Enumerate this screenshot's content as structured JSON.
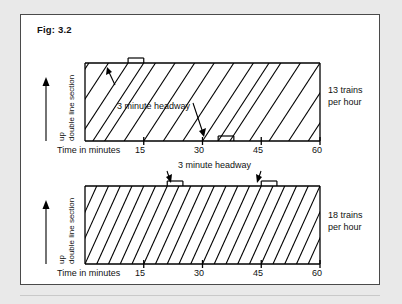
{
  "figure": {
    "title": "Fig: 3.2",
    "background_color": "#e9e9e9",
    "card_color": "#ffffff",
    "border_color": "#4a4a4a",
    "line_color": "#000000"
  },
  "chart_data": [
    {
      "id": "top",
      "type": "line",
      "title": "Fig: 3.2",
      "subtitle": "13 trains per hour",
      "xlabel": "Time in minutes",
      "ylabel": "up  double line section",
      "xlim": [
        0,
        60
      ],
      "xticks": [
        15,
        30,
        45,
        60
      ],
      "xtick_labels": [
        "15",
        "30",
        "45",
        "60"
      ],
      "grid": false,
      "capacity_label": "13 trains",
      "capacity_label_line2": "per hour",
      "trains_per_hour": 13,
      "headway_minutes": 3,
      "annotation": "3 minute  headway",
      "series": [
        {
          "name": "train-path",
          "x_bottom": -12,
          "x_top": 1
        },
        {
          "name": "train-path",
          "x_bottom": -7,
          "x_top": 6
        },
        {
          "name": "train-path",
          "x_bottom": -2,
          "x_top": 11
        },
        {
          "name": "train-path",
          "x_bottom": 2,
          "x_top": 15
        },
        {
          "name": "train-path",
          "x_bottom": 5,
          "x_top": 18
        },
        {
          "name": "train-path",
          "x_bottom": 10,
          "x_top": 23
        },
        {
          "name": "train-path",
          "x_bottom": 15,
          "x_top": 28
        },
        {
          "name": "train-path",
          "x_bottom": 20,
          "x_top": 33
        },
        {
          "name": "train-path",
          "x_bottom": 25,
          "x_top": 38
        },
        {
          "name": "train-path",
          "x_bottom": 30,
          "x_top": 43
        },
        {
          "name": "train-path",
          "x_bottom": 34,
          "x_top": 47
        },
        {
          "name": "train-path",
          "x_bottom": 37,
          "x_top": 50
        },
        {
          "name": "train-path",
          "x_bottom": 42,
          "x_top": 55
        },
        {
          "name": "train-path",
          "x_bottom": 47,
          "x_top": 60
        },
        {
          "name": "train-path",
          "x_bottom": 52,
          "x_top": 65
        },
        {
          "name": "train-path",
          "x_bottom": 57,
          "x_top": 70
        }
      ],
      "headway_markers": [
        {
          "position": "top",
          "x_start": 11,
          "x_end": 15,
          "arrow": "down-left"
        },
        {
          "position": "bottom",
          "x_start": 34,
          "x_end": 38,
          "arrow": "down-right"
        }
      ]
    },
    {
      "id": "bottom",
      "type": "line",
      "subtitle": "18 trains per hour",
      "xlabel": "Time in minutes",
      "ylabel": "up  double line section",
      "xlim": [
        0,
        60
      ],
      "xticks": [
        15,
        30,
        45,
        60
      ],
      "xtick_labels": [
        "15",
        "30",
        "45",
        "60"
      ],
      "grid": false,
      "capacity_label": "18 trains",
      "capacity_label_line2": "per hour",
      "trains_per_hour": 18,
      "headway_minutes": 3,
      "annotation": "3 minute  headway",
      "series": [
        {
          "name": "train-path",
          "x_bottom": -9,
          "x_top": 0
        },
        {
          "name": "train-path",
          "x_bottom": -6,
          "x_top": 3
        },
        {
          "name": "train-path",
          "x_bottom": -3,
          "x_top": 6
        },
        {
          "name": "train-path",
          "x_bottom": 0,
          "x_top": 9
        },
        {
          "name": "train-path",
          "x_bottom": 3,
          "x_top": 12
        },
        {
          "name": "train-path",
          "x_bottom": 6,
          "x_top": 15
        },
        {
          "name": "train-path",
          "x_bottom": 9,
          "x_top": 18
        },
        {
          "name": "train-path",
          "x_bottom": 12,
          "x_top": 21
        },
        {
          "name": "train-path",
          "x_bottom": 15,
          "x_top": 24
        },
        {
          "name": "train-path",
          "x_bottom": 18,
          "x_top": 27
        },
        {
          "name": "train-path",
          "x_bottom": 21,
          "x_top": 30
        },
        {
          "name": "train-path",
          "x_bottom": 24,
          "x_top": 33
        },
        {
          "name": "train-path",
          "x_bottom": 27,
          "x_top": 36
        },
        {
          "name": "train-path",
          "x_bottom": 30,
          "x_top": 39
        },
        {
          "name": "train-path",
          "x_bottom": 33,
          "x_top": 42
        },
        {
          "name": "train-path",
          "x_bottom": 36,
          "x_top": 45
        },
        {
          "name": "train-path",
          "x_bottom": 39,
          "x_top": 48
        },
        {
          "name": "train-path",
          "x_bottom": 42,
          "x_top": 51
        },
        {
          "name": "train-path",
          "x_bottom": 45,
          "x_top": 54
        },
        {
          "name": "train-path",
          "x_bottom": 48,
          "x_top": 57
        },
        {
          "name": "train-path",
          "x_bottom": 51,
          "x_top": 60
        },
        {
          "name": "train-path",
          "x_bottom": 54,
          "x_top": 63
        },
        {
          "name": "train-path",
          "x_bottom": 57,
          "x_top": 66
        }
      ],
      "headway_markers": [
        {
          "position": "top",
          "x_start": 21,
          "x_end": 25,
          "arrow": "down-left"
        },
        {
          "position": "top",
          "x_start": 45,
          "x_end": 49,
          "arrow": "down-right"
        }
      ]
    }
  ],
  "labels": {
    "ylabel_up": "up",
    "ylabel_section": "double line section",
    "xlabel": "Time in minutes",
    "headway_note": "3 minute  headway",
    "top_capacity_l1": "13 trains",
    "top_capacity_l2": "per hour",
    "bottom_capacity_l1": "18 trains",
    "bottom_capacity_l2": "per hour",
    "ticks": [
      "15",
      "30",
      "45",
      "60"
    ]
  }
}
